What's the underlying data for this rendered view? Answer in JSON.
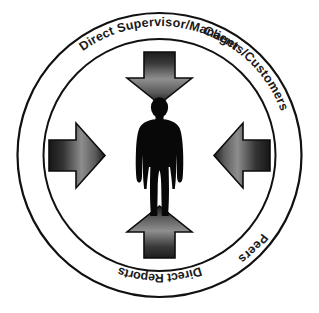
{
  "diagram": {
    "center_figure": {
      "name": "employee-silhouette",
      "description": "person"
    },
    "rings": {
      "outer_radius": 142,
      "inner_radius": 116,
      "center_x": 159.5,
      "center_y": 155,
      "stroke_color": "#111111",
      "outer_stroke_width": 2.2,
      "inner_stroke_width": 2.0
    },
    "labels": {
      "top": "Direct Supervisor/Manager",
      "right": "Clients/Customers",
      "bottom": "Direct Reports",
      "left": "Peers"
    },
    "arrows": [
      {
        "id": "arrow-top",
        "label": "Direct Supervisor/Manager",
        "direction": "down"
      },
      {
        "id": "arrow-right",
        "label": "Clients/Customers",
        "direction": "left"
      },
      {
        "id": "arrow-bottom",
        "label": "Direct Reports",
        "direction": "up"
      },
      {
        "id": "arrow-left",
        "label": "Peers",
        "direction": "right"
      }
    ],
    "colors": {
      "gradient_dark": "#1f1f1f",
      "gradient_light": "#9a9a9a",
      "outline": "#0d0d0d",
      "figure": "#080808",
      "background": "#ffffff"
    },
    "font_sizes": {
      "top_label": 12.5,
      "bottom_label": 12.5,
      "side_label": 12.5
    }
  }
}
